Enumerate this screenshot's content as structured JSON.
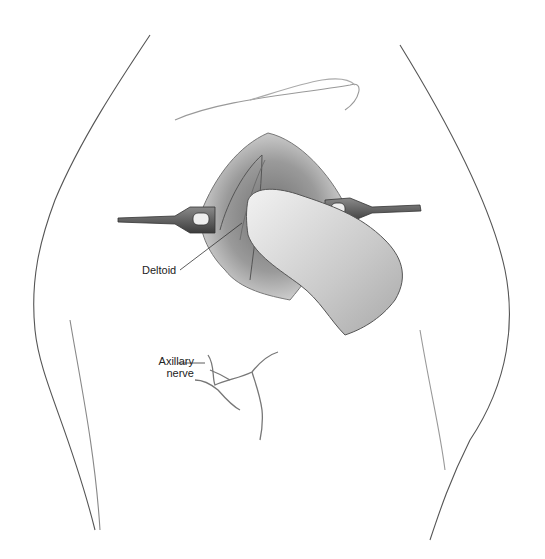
{
  "figure": {
    "labels": {
      "deltoid": "Deltoid",
      "axillary_nerve_line1": "Axillary",
      "axillary_nerve_line2": "nerve"
    },
    "colors": {
      "outline": "#3a3a3a",
      "skin_shade": "#d9d9d9",
      "wound_dark": "#5a5a5a",
      "retractor": "#4a4a4a"
    }
  }
}
